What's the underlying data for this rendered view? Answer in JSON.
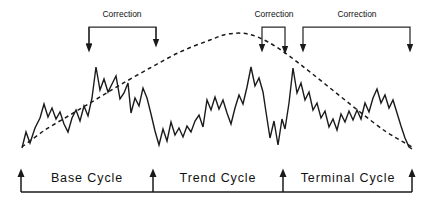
{
  "figure": {
    "background_color": "#ffffff",
    "line_color": "#1a1a1a",
    "width": 434,
    "height": 203
  },
  "annotations": {
    "corrections": [
      {
        "label": "Correction",
        "label_x": 122,
        "label_y": 17,
        "left_x": 89,
        "right_x": 156,
        "top_y": 27,
        "left_arrow_y": 50,
        "right_arrow_y": 45
      },
      {
        "label": "Correction",
        "label_x": 274,
        "label_y": 17,
        "left_x": 262,
        "right_x": 285,
        "top_y": 27,
        "left_arrow_y": 50,
        "right_arrow_y": 52
      },
      {
        "label": "Correction",
        "label_x": 357,
        "label_y": 17,
        "left_x": 303,
        "right_x": 410,
        "top_y": 27,
        "left_arrow_y": 50,
        "right_arrow_y": 50
      }
    ]
  },
  "axis": {
    "baseline_y": 192,
    "start_x": 21,
    "end_x": 412,
    "markers": [
      {
        "x": 21,
        "name": "cycle-marker-1"
      },
      {
        "x": 153,
        "name": "cycle-marker-2"
      },
      {
        "x": 283,
        "name": "cycle-marker-3"
      },
      {
        "x": 412,
        "name": "cycle-marker-4"
      }
    ],
    "cycles": [
      {
        "label": "Base Cycle",
        "center_x": 87,
        "label_y": 182
      },
      {
        "label": "Trend Cycle",
        "center_x": 218,
        "label_y": 182
      },
      {
        "label": "Terminal Cycle",
        "center_x": 348,
        "label_y": 182
      }
    ]
  },
  "chart_data": {
    "type": "line",
    "xlabel": "",
    "ylabel": "",
    "grid": false,
    "legend": "none",
    "xlim": [
      0,
      434
    ],
    "ylim_pixels": [
      25,
      155
    ],
    "note": "y values are screen pixel coordinates (smaller y = higher price)",
    "series": [
      {
        "name": "price-zigzag",
        "style": "solid",
        "color": "#1a1a1a",
        "points": [
          [
            22,
            148
          ],
          [
            26,
            132
          ],
          [
            30,
            143
          ],
          [
            35,
            128
          ],
          [
            40,
            118
          ],
          [
            44,
            104
          ],
          [
            48,
            117
          ],
          [
            52,
            108
          ],
          [
            56,
            119
          ],
          [
            60,
            112
          ],
          [
            64,
            124
          ],
          [
            68,
            132
          ],
          [
            72,
            118
          ],
          [
            76,
            110
          ],
          [
            80,
            121
          ],
          [
            84,
            106
          ],
          [
            88,
            116
          ],
          [
            92,
            98
          ],
          [
            96,
            67
          ],
          [
            100,
            90
          ],
          [
            104,
            79
          ],
          [
            108,
            92
          ],
          [
            112,
            84
          ],
          [
            116,
            76
          ],
          [
            120,
            99
          ],
          [
            124,
            93
          ],
          [
            128,
            83
          ],
          [
            131,
            113
          ],
          [
            135,
            98
          ],
          [
            139,
            106
          ],
          [
            143,
            88
          ],
          [
            147,
            98
          ],
          [
            151,
            114
          ],
          [
            155,
            131
          ],
          [
            159,
            145
          ],
          [
            163,
            129
          ],
          [
            167,
            141
          ],
          [
            171,
            122
          ],
          [
            175,
            135
          ],
          [
            179,
            128
          ],
          [
            183,
            137
          ],
          [
            187,
            126
          ],
          [
            191,
            132
          ],
          [
            195,
            121
          ],
          [
            199,
            115
          ],
          [
            203,
            127
          ],
          [
            207,
            100
          ],
          [
            211,
            110
          ],
          [
            215,
            97
          ],
          [
            219,
            109
          ],
          [
            223,
            100
          ],
          [
            227,
            113
          ],
          [
            231,
            124
          ],
          [
            235,
            108
          ],
          [
            239,
            95
          ],
          [
            243,
            104
          ],
          [
            247,
            87
          ],
          [
            251,
            67
          ],
          [
            255,
            86
          ],
          [
            259,
            78
          ],
          [
            263,
            92
          ],
          [
            266,
            112
          ],
          [
            270,
            138
          ],
          [
            274,
            121
          ],
          [
            278,
            145
          ],
          [
            282,
            119
          ],
          [
            285,
            129
          ],
          [
            289,
            103
          ],
          [
            293,
            68
          ],
          [
            297,
            93
          ],
          [
            301,
            83
          ],
          [
            305,
            100
          ],
          [
            309,
            92
          ],
          [
            313,
            110
          ],
          [
            317,
            103
          ],
          [
            321,
            118
          ],
          [
            325,
            111
          ],
          [
            329,
            127
          ],
          [
            333,
            119
          ],
          [
            337,
            130
          ],
          [
            341,
            114
          ],
          [
            345,
            122
          ],
          [
            349,
            111
          ],
          [
            353,
            120
          ],
          [
            357,
            110
          ],
          [
            361,
            119
          ],
          [
            365,
            103
          ],
          [
            369,
            112
          ],
          [
            373,
            98
          ],
          [
            377,
            89
          ],
          [
            381,
            103
          ],
          [
            385,
            95
          ],
          [
            389,
            108
          ],
          [
            393,
            100
          ],
          [
            397,
            113
          ],
          [
            401,
            126
          ],
          [
            405,
            138
          ],
          [
            409,
            147
          ],
          [
            412,
            149
          ]
        ]
      },
      {
        "name": "trend-envelope",
        "style": "dashed",
        "color": "#1a1a1a",
        "points": [
          [
            22,
            147
          ],
          [
            45,
            130
          ],
          [
            70,
            115
          ],
          [
            95,
            100
          ],
          [
            120,
            85
          ],
          [
            150,
            68
          ],
          [
            180,
            52
          ],
          [
            210,
            40
          ],
          [
            228,
            34
          ],
          [
            248,
            34
          ],
          [
            268,
            42
          ],
          [
            288,
            55
          ],
          [
            310,
            72
          ],
          [
            335,
            92
          ],
          [
            360,
            112
          ],
          [
            385,
            131
          ],
          [
            405,
            143
          ],
          [
            412,
            147
          ]
        ]
      }
    ]
  }
}
